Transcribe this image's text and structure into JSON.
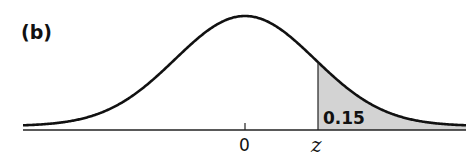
{
  "panel_label": "(b)",
  "colors": {
    "curve": "#111111",
    "axis": "#222222",
    "shaded_area": "#d3d3d3"
  },
  "chart_data": {
    "type": "area",
    "title": "",
    "panel": "(b)",
    "distribution": "standard normal",
    "xlabel": "",
    "ylabel": "",
    "x_ticks": [
      {
        "value": 0,
        "label": "0"
      },
      {
        "value": 1.04,
        "label": "z"
      }
    ],
    "shaded_region": {
      "from": "z",
      "to": "+inf",
      "area": 0.15
    },
    "annotations": [
      {
        "text": "0.15",
        "position": "inside shaded tail, right of z"
      }
    ],
    "grid": false,
    "legend": null
  }
}
